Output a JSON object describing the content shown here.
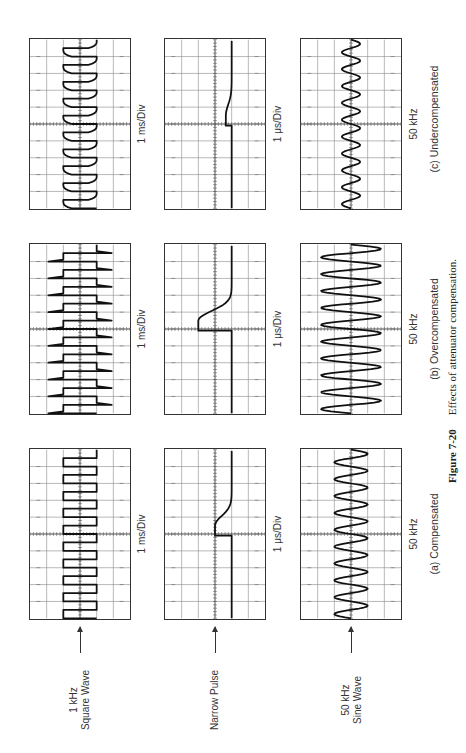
{
  "figure": {
    "number": "Figure 7-20",
    "title": "Effects of attenuator compensation."
  },
  "rows": [
    {
      "label_line1": "1 kHz",
      "label_line2": "Square Wave",
      "timebase": "1 ms/Div"
    },
    {
      "label_line1": "Narrow Pulse",
      "label_line2": "",
      "timebase": "1 μs/Div"
    },
    {
      "label_line1": "50 kHz",
      "label_line2": "Sine Wave",
      "timebase": "50 kHz"
    }
  ],
  "columns": [
    {
      "caption": "(a) Compensated"
    },
    {
      "caption": "(b) Overcompensated"
    },
    {
      "caption": "(c) Undercompensated"
    }
  ],
  "chart_data": {
    "type": "oscilloscope-grid",
    "grid": {
      "horizontal_divisions": 10,
      "vertical_divisions": 6
    },
    "row_labels": [
      "1 kHz Square Wave",
      "Narrow Pulse",
      "50 kHz Sine Wave"
    ],
    "column_labels": [
      "(a) Compensated",
      "(b) Overcompensated",
      "(c) Undercompensated"
    ],
    "timebase_labels": [
      "1 ms/Div",
      "1 μs/Div",
      "50 kHz"
    ],
    "panels": [
      {
        "row": "1 kHz Square Wave",
        "column": "(a) Compensated",
        "waveform": "square",
        "cycles": 10,
        "shape": "flat tops, sharp corners"
      },
      {
        "row": "1 kHz Square Wave",
        "column": "(b) Overcompensated",
        "waveform": "square",
        "cycles": 10,
        "shape": "overshoot spikes at leading edges"
      },
      {
        "row": "1 kHz Square Wave",
        "column": "(c) Undercompensated",
        "waveform": "square",
        "cycles": 10,
        "shape": "rounded leading edges"
      },
      {
        "row": "Narrow Pulse",
        "column": "(a) Compensated",
        "waveform": "pulse",
        "shape": "moderate amplitude step with exponential decay"
      },
      {
        "row": "Narrow Pulse",
        "column": "(b) Overcompensated",
        "waveform": "pulse",
        "shape": "large amplitude spike with long decay"
      },
      {
        "row": "Narrow Pulse",
        "column": "(c) Undercompensated",
        "waveform": "pulse",
        "shape": "small amplitude step with slow decay"
      },
      {
        "row": "50 kHz Sine Wave",
        "column": "(a) Compensated",
        "waveform": "sine",
        "cycles": 10,
        "amplitude_div": 1.0
      },
      {
        "row": "50 kHz Sine Wave",
        "column": "(b) Overcompensated",
        "waveform": "sine",
        "cycles": 10,
        "amplitude_div": 1.8
      },
      {
        "row": "50 kHz Sine Wave",
        "column": "(c) Undercompensated",
        "waveform": "sine",
        "cycles": 10,
        "amplitude_div": 0.55
      }
    ]
  }
}
